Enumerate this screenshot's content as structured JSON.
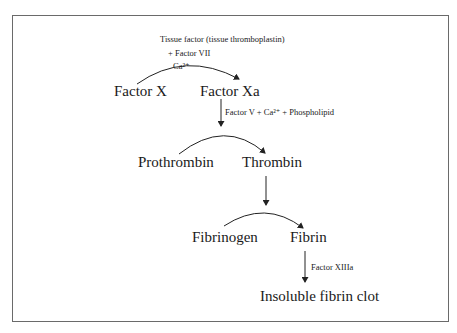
{
  "diagram": {
    "nodes": {
      "factor_x": "Factor X",
      "factor_xa": "Factor Xa",
      "prothrombin": "Prothrombin",
      "thrombin": "Thrombin",
      "fibrinogen": "Fibrinogen",
      "fibrin": "Fibrin",
      "clot": "Insoluble fibrin clot"
    },
    "labels": {
      "tissue_factor": "Tissue factor (tissue thromboplastin)",
      "factor_vii": "+ Factor VII",
      "ca1": "Ca²⁺",
      "factor_v": "Factor V + Ca²⁺ + Phospholipid",
      "factor_xiiia": "Factor XIIIa"
    }
  }
}
